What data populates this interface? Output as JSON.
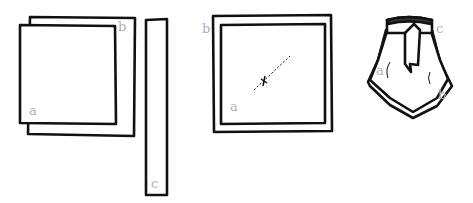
{
  "figures": [
    {
      "id": "step1",
      "labels": {
        "a": "a",
        "b": "b",
        "c": "c"
      },
      "description": "Two overlapping squares (a on top of b) and a long narrow strip c"
    },
    {
      "id": "step2",
      "labels": {
        "a": "a",
        "b": "b"
      },
      "description": "Square a centered on larger square b with a dashed diagonal line and cross mark at center"
    },
    {
      "id": "step3",
      "labels": {
        "a": "a",
        "b": "b",
        "c": "c"
      },
      "description": "Folded squares gathered under band c, forming a pointed skirt shape"
    }
  ],
  "colors": {
    "stroke": "#111111",
    "label": "#b0b0b0",
    "band_fill": "#333333"
  }
}
